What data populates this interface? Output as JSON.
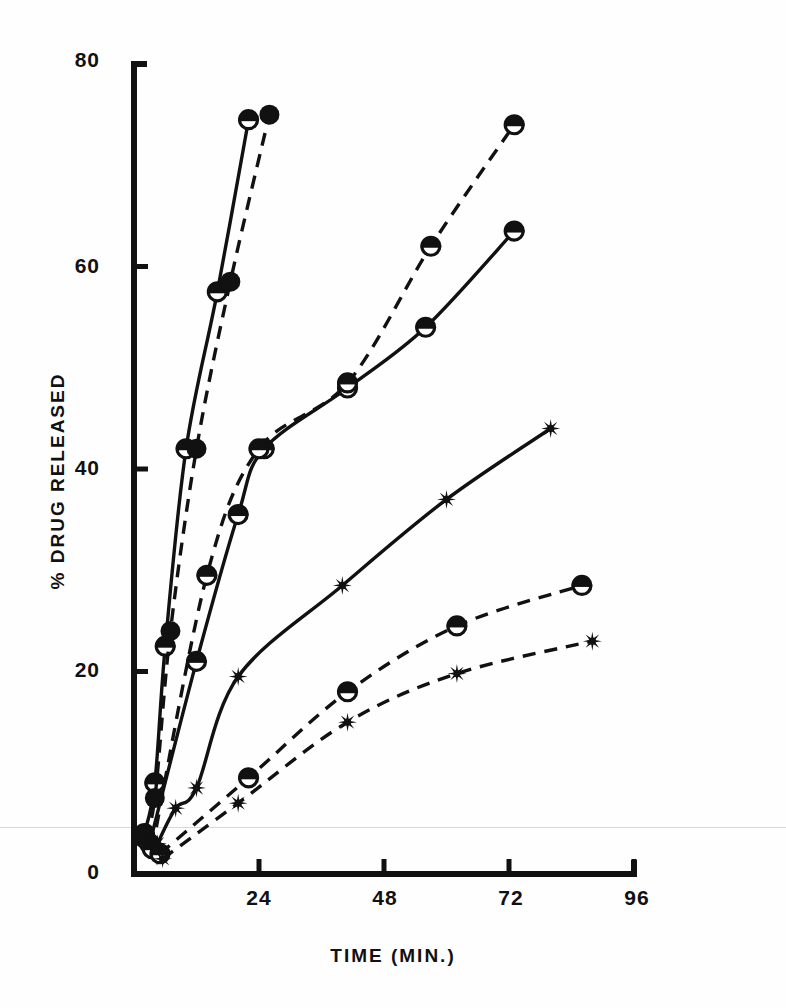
{
  "figure": {
    "background_color": "#fefefe",
    "ink_color": "#111111"
  },
  "chart_data": {
    "type": "line",
    "title": "",
    "subtitle": "",
    "xlabel": "TIME (MIN.)",
    "ylabel": "% DRUG RELEASED",
    "xlim": [
      0,
      96
    ],
    "ylim": [
      0,
      80
    ],
    "xticks": [
      0,
      24,
      48,
      72,
      96
    ],
    "xticklabels": [
      "0",
      "24",
      "48",
      "72",
      "96"
    ],
    "yticks": [
      0,
      20,
      40,
      60,
      80
    ],
    "yticklabels": [
      "0",
      "20",
      "40",
      "60",
      "80"
    ],
    "grid": false,
    "legend": "none",
    "series": [
      {
        "name": "series-1-halfcircle-solid",
        "marker": "half-filled-circle",
        "line": "solid",
        "points": [
          {
            "x": 2,
            "y": 4
          },
          {
            "x": 4,
            "y": 9
          },
          {
            "x": 6,
            "y": 22.5
          },
          {
            "x": 10,
            "y": 42
          },
          {
            "x": 16,
            "y": 57.5
          },
          {
            "x": 22,
            "y": 74.5
          }
        ]
      },
      {
        "name": "series-2-filledcircle-dashed",
        "marker": "filled-circle",
        "line": "dashed",
        "points": [
          {
            "x": 2,
            "y": 3.5
          },
          {
            "x": 4,
            "y": 7.5
          },
          {
            "x": 7,
            "y": 24
          },
          {
            "x": 12,
            "y": 42
          },
          {
            "x": 18.5,
            "y": 58.5
          },
          {
            "x": 26,
            "y": 75
          }
        ]
      },
      {
        "name": "series-3-halfcircle-solid-mid",
        "marker": "half-filled-circle",
        "line": "solid",
        "points": [
          {
            "x": 3,
            "y": 3
          },
          {
            "x": 12,
            "y": 21
          },
          {
            "x": 20,
            "y": 35.5
          },
          {
            "x": 25,
            "y": 42
          },
          {
            "x": 41,
            "y": 48
          },
          {
            "x": 56,
            "y": 54
          },
          {
            "x": 73,
            "y": 63.5
          }
        ]
      },
      {
        "name": "series-4-halfcircle-dashed-mid",
        "marker": "half-filled-circle",
        "line": "dashed",
        "points": [
          {
            "x": 3.5,
            "y": 2.5
          },
          {
            "x": 14,
            "y": 29.5
          },
          {
            "x": 24,
            "y": 42
          },
          {
            "x": 41,
            "y": 48.5
          },
          {
            "x": 57,
            "y": 62
          },
          {
            "x": 73,
            "y": 74
          }
        ]
      },
      {
        "name": "series-5-star-solid",
        "marker": "star",
        "line": "solid",
        "points": [
          {
            "x": 4.5,
            "y": 3
          },
          {
            "x": 8,
            "y": 6.5
          },
          {
            "x": 12,
            "y": 8.5
          },
          {
            "x": 20,
            "y": 19.5
          },
          {
            "x": 40,
            "y": 28.5
          },
          {
            "x": 60,
            "y": 37
          },
          {
            "x": 80,
            "y": 44
          }
        ]
      },
      {
        "name": "series-6-halfcircle-dashed-low",
        "marker": "half-filled-circle",
        "line": "dashed",
        "points": [
          {
            "x": 5,
            "y": 2
          },
          {
            "x": 22,
            "y": 9.5
          },
          {
            "x": 41,
            "y": 18
          },
          {
            "x": 62,
            "y": 24.5
          },
          {
            "x": 86,
            "y": 28.5
          }
        ]
      },
      {
        "name": "series-7-star-dashed-low",
        "marker": "star",
        "line": "dashed",
        "points": [
          {
            "x": 5.5,
            "y": 1.5
          },
          {
            "x": 20,
            "y": 7
          },
          {
            "x": 41,
            "y": 15
          },
          {
            "x": 62,
            "y": 19.8
          },
          {
            "x": 88,
            "y": 23
          }
        ]
      }
    ]
  }
}
